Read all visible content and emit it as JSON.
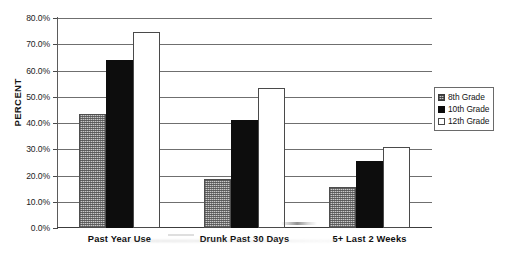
{
  "chart_data": {
    "type": "bar",
    "title": "",
    "xlabel": "",
    "ylabel": "PERCENT",
    "categories": [
      "Past Year Use",
      "Drunk Past 30 Days",
      "5+ Last 2 Weeks"
    ],
    "series": [
      {
        "name": "8th Grade",
        "values": [
          43.5,
          18.5,
          15.5
        ],
        "color": "#c9c9c9",
        "pattern": "checker"
      },
      {
        "name": "10th Grade",
        "values": [
          64.0,
          41.0,
          25.5
        ],
        "color": "#0d0d0d",
        "pattern": "solid"
      },
      {
        "name": "12th Grade",
        "values": [
          74.5,
          53.5,
          31.0
        ],
        "color": "#ffffff",
        "pattern": "outline"
      }
    ],
    "ylim": [
      0,
      80
    ],
    "ytick_values": [
      0,
      10,
      20,
      30,
      40,
      50,
      60,
      70,
      80
    ],
    "ytick_labels": [
      "0.0%",
      "10.0%",
      "20.0%",
      "30.0%",
      "40.0%",
      "50.0%",
      "60.0%",
      "70.0%",
      "80.0%"
    ],
    "grid": true,
    "legend_position": "right"
  },
  "legend": {
    "items": [
      {
        "label": "8th Grade"
      },
      {
        "label": "10th Grade"
      },
      {
        "label": "12th Grade"
      }
    ]
  }
}
